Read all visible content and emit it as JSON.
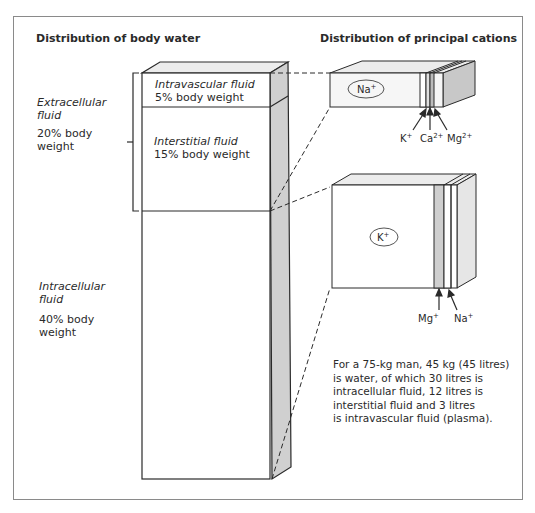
{
  "titles": {
    "left": "Distribution of body water",
    "right": "Distribution of principal cations"
  },
  "compartments": {
    "intravascular": {
      "name": "Intravascular fluid",
      "value": "5% body weight"
    },
    "interstitial": {
      "name": "Interstitial fluid",
      "value": "15% body weight"
    },
    "extracellular": {
      "name_line1": "Extracellular",
      "name_line2": "fluid",
      "value_line1": "20% body",
      "value_line2": "weight"
    },
    "intracellular": {
      "name_line1": "Intracellular",
      "name_line2": "fluid",
      "value_line1": "40% body",
      "value_line2": "weight"
    }
  },
  "ecf_cations": {
    "main": {
      "symbol": "Na",
      "charge": "+"
    },
    "minor": [
      {
        "symbol": "K",
        "charge": "+"
      },
      {
        "symbol": "Ca",
        "charge": "2+"
      },
      {
        "symbol": "Mg",
        "charge": "2+"
      }
    ]
  },
  "icf_cations": {
    "main": {
      "symbol": "K",
      "charge": "+"
    },
    "minor": [
      {
        "symbol": "Mg",
        "charge": "+"
      },
      {
        "symbol": "Na",
        "charge": "+"
      }
    ]
  },
  "note": {
    "line1": "For a 75-kg man, 45 kg (45 litres)",
    "line2": "is water, of which 30 litres is",
    "line3": "intracellular fluid, 12 litres is",
    "line4": "interstitial fluid and 3 litres",
    "line5": "is intravascular fluid (plasma)."
  },
  "colors": {
    "line": "#2a2a2a",
    "side_shade": "#d0d0d0",
    "top_shade": "#ececec",
    "box_fill": "#f4f4f4"
  }
}
